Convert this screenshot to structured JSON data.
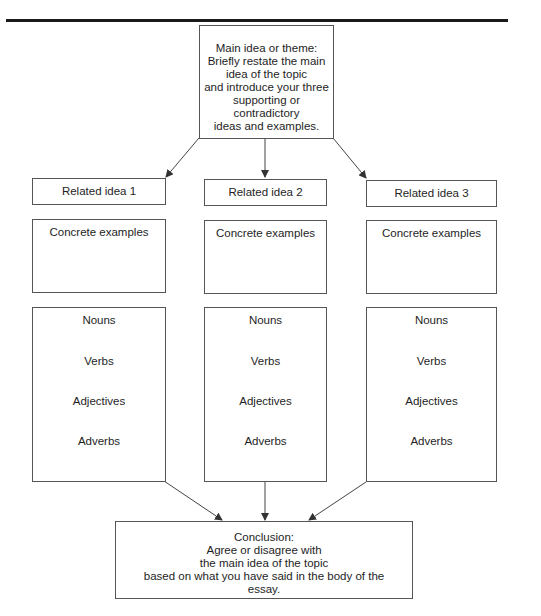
{
  "page": {
    "clipped_heading": "Example Diagram",
    "rule_color": "#1a1a1a",
    "box_border_color": "#555555",
    "arrow_color": "#444444"
  },
  "main_idea": {
    "lines": [
      "Main idea or theme:",
      "Briefly restate the main",
      "idea of the topic",
      "and introduce your three",
      "supporting or",
      "contradictory",
      "ideas and examples."
    ]
  },
  "columns": [
    {
      "idea_label": "Related idea 1",
      "examples_label": "Concrete examples",
      "words": [
        "Nouns",
        "Verbs",
        "Adjectives",
        "Adverbs"
      ]
    },
    {
      "idea_label": "Related idea 2",
      "examples_label": "Concrete examples",
      "words": [
        "Nouns",
        "Verbs",
        "Adjectives",
        "Adverbs"
      ]
    },
    {
      "idea_label": "Related idea 3",
      "examples_label": "Concrete examples",
      "words": [
        "Nouns",
        "Verbs",
        "Adjectives",
        "Adverbs"
      ]
    }
  ],
  "conclusion": {
    "lines": [
      "Conclusion:",
      "Agree or disagree with",
      "the main idea of the topic",
      "based on what you have said in the body of the",
      "essay."
    ]
  }
}
